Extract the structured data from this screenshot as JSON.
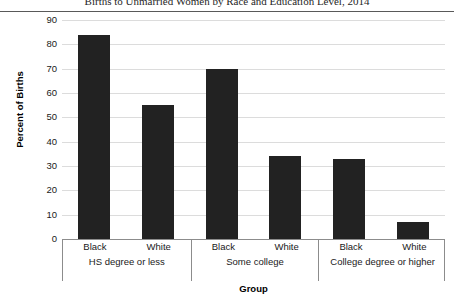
{
  "chart_data": {
    "type": "bar",
    "title": "Births to Unmarried Women by Race and Education Level, 2014",
    "xlabel": "Group",
    "ylabel": "Percent of Births",
    "ylim": [
      0,
      90
    ],
    "ytick_step": 10,
    "yticks": [
      "90",
      "80",
      "70",
      "60",
      "50",
      "40",
      "30",
      "20",
      "10",
      "0"
    ],
    "grid": true,
    "legend": "none",
    "categories": [
      "HS degree or less",
      "Some college",
      "College degree or higher"
    ],
    "subcategories": [
      "Black",
      "White"
    ],
    "groups": [
      {
        "label": "HS degree or less",
        "bars": [
          {
            "label": "Black",
            "value": 84
          },
          {
            "label": "White",
            "value": 55
          }
        ]
      },
      {
        "label": "Some college",
        "bars": [
          {
            "label": "Black",
            "value": 70
          },
          {
            "label": "White",
            "value": 34
          }
        ]
      },
      {
        "label": "College degree or higher",
        "bars": [
          {
            "label": "Black",
            "value": 33
          },
          {
            "label": "White",
            "value": 7
          }
        ]
      }
    ],
    "series": [
      {
        "name": "Black",
        "values": [
          84,
          70,
          33
        ]
      },
      {
        "name": "White",
        "values": [
          55,
          34,
          7
        ]
      }
    ],
    "colors": {
      "bar": "#222222",
      "gridline": "#dcdcdc",
      "axis": "#8c8c8c",
      "title_rule": "#595959",
      "text": "#1a1a1a"
    }
  }
}
